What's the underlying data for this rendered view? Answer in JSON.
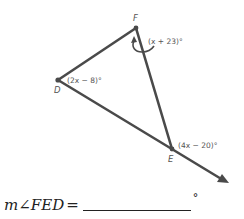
{
  "diagram": {
    "vertices": {
      "F": {
        "label": "F",
        "x": 136,
        "y": 28
      },
      "D": {
        "label": "D",
        "x": 58,
        "y": 80
      },
      "E": {
        "label": "E",
        "x": 172,
        "y": 149
      }
    },
    "ray_end": {
      "x": 229,
      "y": 183
    },
    "angle_labels": {
      "F_exterior": "(x + 23)°",
      "D": "(2x − 8)°",
      "E_exterior": "(4x − 20)°"
    },
    "colors": {
      "line": "#4a4a4a",
      "text": "#555555"
    }
  },
  "question": {
    "label": "m∠FED",
    "equals": "=",
    "degree_symbol": "°",
    "answer_value": ""
  }
}
